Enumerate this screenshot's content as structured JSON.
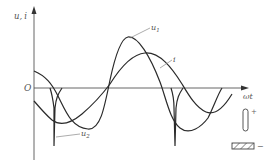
{
  "diagram": {
    "y_axis_label": "u, i",
    "y_axis_label_main": "u",
    "y_axis_label_sep": ",",
    "y_axis_label_i": "i",
    "x_axis_label": "ωt",
    "origin_label": "O",
    "curves": [
      {
        "name": "u1",
        "label": "u",
        "subscript": "1"
      },
      {
        "name": "i",
        "label": "i",
        "subscript": ""
      },
      {
        "name": "u2",
        "label": "u",
        "subscript": "2"
      }
    ],
    "legend": {
      "plus_label": "+",
      "minus_label": "−"
    }
  }
}
